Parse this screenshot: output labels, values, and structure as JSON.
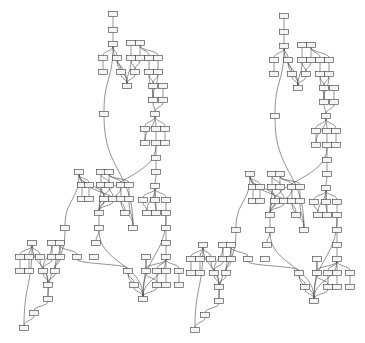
{
  "diagram": {
    "type": "layered-graph",
    "node_size": [
      9,
      5
    ],
    "colors": {
      "background": "#ffffff",
      "node_fill": "#f4f4f4",
      "node_stroke": "#3a3a3a",
      "edge": "#4a4a4a"
    },
    "panels": [
      {
        "id": "left",
        "offset": [
          0,
          0
        ]
      },
      {
        "id": "right",
        "offset": [
          171,
          2
        ]
      }
    ],
    "nodes": [
      {
        "id": "a0",
        "x": 113,
        "y": 14
      },
      {
        "id": "a1",
        "x": 113,
        "y": 30
      },
      {
        "id": "a2",
        "x": 113,
        "y": 44
      },
      {
        "id": "b1",
        "x": 131,
        "y": 43
      },
      {
        "id": "b2",
        "x": 140,
        "y": 43
      },
      {
        "id": "c1",
        "x": 103,
        "y": 58
      },
      {
        "id": "c2",
        "x": 117,
        "y": 58
      },
      {
        "id": "c3",
        "x": 131,
        "y": 58
      },
      {
        "id": "c4",
        "x": 140,
        "y": 58
      },
      {
        "id": "c5",
        "x": 149,
        "y": 58
      },
      {
        "id": "c6",
        "x": 158,
        "y": 58
      },
      {
        "id": "d1",
        "x": 103,
        "y": 72
      },
      {
        "id": "d2",
        "x": 121,
        "y": 72
      },
      {
        "id": "d3",
        "x": 135,
        "y": 72
      },
      {
        "id": "d4",
        "x": 149,
        "y": 72
      },
      {
        "id": "d5",
        "x": 158,
        "y": 72
      },
      {
        "id": "e1",
        "x": 127,
        "y": 86
      },
      {
        "id": "e2",
        "x": 153,
        "y": 86
      },
      {
        "id": "e3",
        "x": 163,
        "y": 86
      },
      {
        "id": "f1",
        "x": 153,
        "y": 100
      },
      {
        "id": "f2",
        "x": 163,
        "y": 100
      },
      {
        "id": "g1",
        "x": 104,
        "y": 114
      },
      {
        "id": "g2",
        "x": 155,
        "y": 114
      },
      {
        "id": "h1",
        "x": 145,
        "y": 129
      },
      {
        "id": "h2",
        "x": 156,
        "y": 129
      },
      {
        "id": "h3",
        "x": 165,
        "y": 129
      },
      {
        "id": "i1",
        "x": 145,
        "y": 143
      },
      {
        "id": "i2",
        "x": 156,
        "y": 143
      },
      {
        "id": "i3",
        "x": 165,
        "y": 143
      },
      {
        "id": "j1",
        "x": 156,
        "y": 158
      },
      {
        "id": "j2",
        "x": 156,
        "y": 172
      },
      {
        "id": "k0",
        "x": 79,
        "y": 172
      },
      {
        "id": "k1",
        "x": 101,
        "y": 172
      },
      {
        "id": "k2",
        "x": 109,
        "y": 172
      },
      {
        "id": "l1",
        "x": 82,
        "y": 185
      },
      {
        "id": "l2",
        "x": 89,
        "y": 185
      },
      {
        "id": "l3",
        "x": 101,
        "y": 185
      },
      {
        "id": "l4",
        "x": 109,
        "y": 185
      },
      {
        "id": "l5",
        "x": 121,
        "y": 185
      },
      {
        "id": "l6",
        "x": 129,
        "y": 185
      },
      {
        "id": "l7",
        "x": 155,
        "y": 186
      },
      {
        "id": "m1",
        "x": 82,
        "y": 199
      },
      {
        "id": "m2",
        "x": 89,
        "y": 199
      },
      {
        "id": "m3",
        "x": 104,
        "y": 199
      },
      {
        "id": "m4",
        "x": 113,
        "y": 199
      },
      {
        "id": "m5",
        "x": 121,
        "y": 199
      },
      {
        "id": "m6",
        "x": 129,
        "y": 199
      },
      {
        "id": "m7",
        "x": 143,
        "y": 200
      },
      {
        "id": "m8",
        "x": 155,
        "y": 200
      },
      {
        "id": "m9",
        "x": 166,
        "y": 200
      },
      {
        "id": "n1",
        "x": 99,
        "y": 213
      },
      {
        "id": "n2",
        "x": 125,
        "y": 213
      },
      {
        "id": "n3",
        "x": 147,
        "y": 213
      },
      {
        "id": "n4",
        "x": 156,
        "y": 213
      },
      {
        "id": "n5",
        "x": 166,
        "y": 213
      },
      {
        "id": "o1",
        "x": 65,
        "y": 228
      },
      {
        "id": "o2",
        "x": 99,
        "y": 228
      },
      {
        "id": "o3",
        "x": 133,
        "y": 228
      },
      {
        "id": "o4",
        "x": 166,
        "y": 228
      },
      {
        "id": "p1",
        "x": 96,
        "y": 243
      },
      {
        "id": "p2",
        "x": 166,
        "y": 243
      },
      {
        "id": "q0",
        "x": 32,
        "y": 243
      },
      {
        "id": "q1",
        "x": 52,
        "y": 243
      },
      {
        "id": "q2",
        "x": 60,
        "y": 243
      },
      {
        "id": "r1",
        "x": 20,
        "y": 257
      },
      {
        "id": "r2",
        "x": 29,
        "y": 257
      },
      {
        "id": "r3",
        "x": 40,
        "y": 257
      },
      {
        "id": "r4",
        "x": 52,
        "y": 257
      },
      {
        "id": "r5",
        "x": 60,
        "y": 257
      },
      {
        "id": "r6",
        "x": 77,
        "y": 257
      },
      {
        "id": "r7",
        "x": 94,
        "y": 257
      },
      {
        "id": "r8",
        "x": 146,
        "y": 257
      },
      {
        "id": "r9",
        "x": 166,
        "y": 257
      },
      {
        "id": "s1",
        "x": 20,
        "y": 271
      },
      {
        "id": "s2",
        "x": 29,
        "y": 271
      },
      {
        "id": "s3",
        "x": 43,
        "y": 271
      },
      {
        "id": "s4",
        "x": 55,
        "y": 271
      },
      {
        "id": "s5",
        "x": 128,
        "y": 271
      },
      {
        "id": "s6",
        "x": 146,
        "y": 271
      },
      {
        "id": "s7",
        "x": 157,
        "y": 271
      },
      {
        "id": "s8",
        "x": 166,
        "y": 271
      },
      {
        "id": "s9",
        "x": 179,
        "y": 271
      },
      {
        "id": "t1",
        "x": 48,
        "y": 285
      },
      {
        "id": "t2",
        "x": 134,
        "y": 285
      },
      {
        "id": "t3",
        "x": 157,
        "y": 285
      },
      {
        "id": "t4",
        "x": 166,
        "y": 285
      },
      {
        "id": "t5",
        "x": 179,
        "y": 285
      },
      {
        "id": "u1",
        "x": 48,
        "y": 299
      },
      {
        "id": "u2",
        "x": 143,
        "y": 299
      },
      {
        "id": "v1",
        "x": 34,
        "y": 313
      },
      {
        "id": "w1",
        "x": 24,
        "y": 328
      }
    ],
    "edges": [
      [
        "a0",
        "a1"
      ],
      [
        "a1",
        "a2"
      ],
      [
        "a2",
        "c1"
      ],
      [
        "a2",
        "c2"
      ],
      [
        "a2",
        "e1"
      ],
      [
        "a2",
        "g1"
      ],
      [
        "b1",
        "c3"
      ],
      [
        "b2",
        "c4"
      ],
      [
        "b2",
        "c5"
      ],
      [
        "b2",
        "c6"
      ],
      [
        "c1",
        "d1"
      ],
      [
        "c2",
        "d2"
      ],
      [
        "c2",
        "e1"
      ],
      [
        "c3",
        "d3"
      ],
      [
        "c3",
        "e1"
      ],
      [
        "c4",
        "d3"
      ],
      [
        "c5",
        "d4"
      ],
      [
        "c6",
        "d5"
      ],
      [
        "d2",
        "e1"
      ],
      [
        "d3",
        "e1"
      ],
      [
        "d4",
        "e2"
      ],
      [
        "d5",
        "e2"
      ],
      [
        "d4",
        "f1"
      ],
      [
        "d5",
        "f1"
      ],
      [
        "e3",
        "f2"
      ],
      [
        "e2",
        "f1"
      ],
      [
        "f1",
        "g2"
      ],
      [
        "f2",
        "g2"
      ],
      [
        "g2",
        "h1"
      ],
      [
        "g2",
        "h2"
      ],
      [
        "g2",
        "h3"
      ],
      [
        "g2",
        "i1"
      ],
      [
        "h1",
        "i1"
      ],
      [
        "h2",
        "i2"
      ],
      [
        "h3",
        "i3"
      ],
      [
        "i2",
        "j1"
      ],
      [
        "j1",
        "j2"
      ],
      [
        "g1",
        "o3"
      ],
      [
        "i2",
        "n1"
      ],
      [
        "k0",
        "l1"
      ],
      [
        "k0",
        "l2"
      ],
      [
        "k0",
        "m3"
      ],
      [
        "k0",
        "n2"
      ],
      [
        "k0",
        "o1"
      ],
      [
        "k1",
        "l3"
      ],
      [
        "k1",
        "l4"
      ],
      [
        "k2",
        "l4"
      ],
      [
        "k2",
        "l5"
      ],
      [
        "k2",
        "l6"
      ],
      [
        "l1",
        "m1"
      ],
      [
        "l2",
        "m2"
      ],
      [
        "l3",
        "m3"
      ],
      [
        "l4",
        "m4"
      ],
      [
        "l5",
        "m5"
      ],
      [
        "l6",
        "m6"
      ],
      [
        "l3",
        "n1"
      ],
      [
        "m3",
        "n1"
      ],
      [
        "m4",
        "n1"
      ],
      [
        "l5",
        "n1"
      ],
      [
        "m5",
        "o3"
      ],
      [
        "m6",
        "o3"
      ],
      [
        "j2",
        "l7"
      ],
      [
        "l7",
        "m7"
      ],
      [
        "l7",
        "m8"
      ],
      [
        "l7",
        "m9"
      ],
      [
        "l7",
        "n3"
      ],
      [
        "l7",
        "n4"
      ],
      [
        "m7",
        "n3"
      ],
      [
        "m8",
        "n4"
      ],
      [
        "m9",
        "n5"
      ],
      [
        "n5",
        "o4"
      ],
      [
        "o4",
        "p2"
      ],
      [
        "p2",
        "r9"
      ],
      [
        "n1",
        "o2"
      ],
      [
        "o2",
        "p1"
      ],
      [
        "n5",
        "u2"
      ],
      [
        "q0",
        "r1"
      ],
      [
        "q0",
        "r2"
      ],
      [
        "q0",
        "r3"
      ],
      [
        "q0",
        "t1"
      ],
      [
        "q0",
        "w1"
      ],
      [
        "q1",
        "r4"
      ],
      [
        "q1",
        "s3"
      ],
      [
        "q2",
        "r5"
      ],
      [
        "q2",
        "r6"
      ],
      [
        "q2",
        "s4"
      ],
      [
        "r1",
        "s1"
      ],
      [
        "r2",
        "s2"
      ],
      [
        "r4",
        "s3"
      ],
      [
        "r5",
        "s4"
      ],
      [
        "r3",
        "t1"
      ],
      [
        "s3",
        "t1"
      ],
      [
        "s4",
        "t1"
      ],
      [
        "t1",
        "u1"
      ],
      [
        "u1",
        "v1"
      ],
      [
        "v1",
        "w1"
      ],
      [
        "r6",
        "s5"
      ],
      [
        "o1",
        "u1"
      ],
      [
        "r8",
        "s6"
      ],
      [
        "r9",
        "s7"
      ],
      [
        "r9",
        "s8"
      ],
      [
        "r9",
        "s9"
      ],
      [
        "r9",
        "s6"
      ],
      [
        "s6",
        "t3"
      ],
      [
        "s7",
        "t3"
      ],
      [
        "s8",
        "t4"
      ],
      [
        "s9",
        "t5"
      ],
      [
        "s5",
        "t2"
      ],
      [
        "s5",
        "u2"
      ],
      [
        "t2",
        "u2"
      ],
      [
        "r8",
        "u2"
      ],
      [
        "r9",
        "u2"
      ],
      [
        "t3",
        "u2"
      ],
      [
        "o2",
        "u2"
      ]
    ]
  }
}
